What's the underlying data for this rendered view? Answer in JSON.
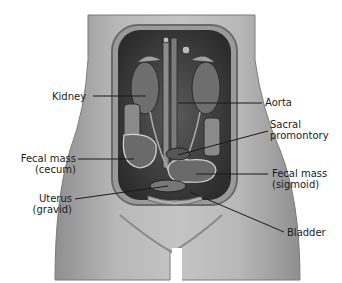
{
  "figure": {
    "colors": {
      "background": "#ffffff",
      "skin_light": "#c8c8c8",
      "skin_mid": "#a8a8a8",
      "cavity_dark": "#3a3a3a",
      "organ_mid": "#6a6a6a",
      "label_text": "#1a1a1a",
      "leader_line": "#1a1a1a"
    }
  },
  "labels": [
    {
      "id": "kidney",
      "line1": "Kidney",
      "line2": ""
    },
    {
      "id": "aorta",
      "line1": "Aorta",
      "line2": ""
    },
    {
      "id": "sacral-promontory",
      "line1": "Sacral",
      "line2": "promontory"
    },
    {
      "id": "fecal-mass-cecum",
      "line1": "Fecal mass",
      "line2": "(cecum)"
    },
    {
      "id": "fecal-mass-sigmoid",
      "line1": "Fecal mass",
      "line2": "(sigmoid)"
    },
    {
      "id": "uterus-gravid",
      "line1": "Uterus",
      "line2": "(gravid)"
    },
    {
      "id": "bladder",
      "line1": "Bladder",
      "line2": ""
    }
  ]
}
